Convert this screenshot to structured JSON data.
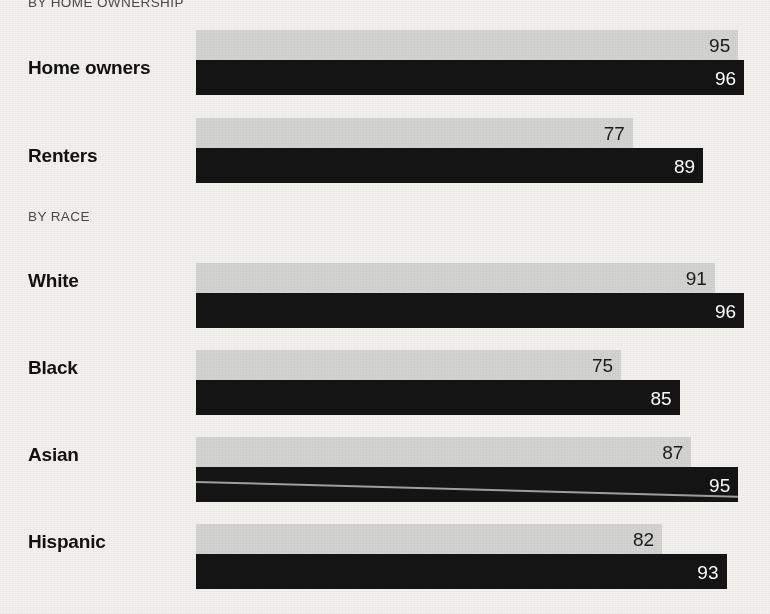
{
  "sections": [
    {
      "id": "ownership",
      "heading": "BY HOME OWNERSHIP"
    },
    {
      "id": "race",
      "heading": "BY RACE"
    }
  ],
  "rows": [
    {
      "label": "Home owners",
      "light": 95,
      "dark": 96
    },
    {
      "label": "Renters",
      "light": 77,
      "dark": 89
    },
    {
      "label": "White",
      "light": 91,
      "dark": 96
    },
    {
      "label": "Black",
      "light": 75,
      "dark": 85
    },
    {
      "label": "Asian",
      "light": 87,
      "dark": 95
    },
    {
      "label": "Hispanic",
      "light": 82,
      "dark": 93
    }
  ],
  "colors": {
    "background": "#f2f1ee",
    "light_bar": "#d3d3d1",
    "dark_bar": "#141414",
    "label_text": "#111111",
    "heading_text": "#4a4a4a",
    "value_on_light": "#1a1a1a",
    "value_on_dark": "#ffffff"
  },
  "chart_data": {
    "type": "bar",
    "orientation": "horizontal",
    "title": "",
    "subtitle": "",
    "xlabel": "",
    "ylabel": "",
    "grid": false,
    "legend": null,
    "legend_position": "none",
    "xlim": [
      0,
      100
    ],
    "groups": [
      {
        "heading": "BY HOME OWNERSHIP",
        "categories": [
          "Home owners",
          "Renters"
        ],
        "series": [
          {
            "name": "light",
            "values": [
              95,
              77
            ]
          },
          {
            "name": "dark",
            "values": [
              96,
              89
            ]
          }
        ]
      },
      {
        "heading": "BY RACE",
        "categories": [
          "White",
          "Black",
          "Asian",
          "Hispanic"
        ],
        "series": [
          {
            "name": "light",
            "values": [
              91,
              75,
              87,
              82
            ]
          },
          {
            "name": "dark",
            "values": [
              96,
              85,
              95,
              93
            ]
          }
        ]
      }
    ],
    "categories": [
      "Home owners",
      "Renters",
      "White",
      "Black",
      "Asian",
      "Hispanic"
    ],
    "series": [
      {
        "name": "light",
        "values": [
          95,
          77,
          91,
          75,
          87,
          82
        ]
      },
      {
        "name": "dark",
        "values": [
          96,
          89,
          96,
          85,
          95,
          93
        ]
      }
    ],
    "annotations": [
      {
        "text": "diagonal scan artifact line across the Asian dark bar"
      }
    ]
  }
}
